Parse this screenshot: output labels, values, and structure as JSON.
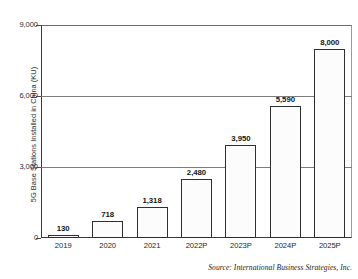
{
  "chart_data": {
    "type": "bar",
    "title": "",
    "subtitle": "",
    "xlabel": "",
    "ylabel": "5G Base Stations Installed in China (KU)",
    "categories": [
      "2019",
      "2020",
      "2021",
      "2022P",
      "2023P",
      "2024P",
      "2025P"
    ],
    "values": [
      130,
      718,
      1318,
      2480,
      3950,
      5590,
      8000
    ],
    "value_labels": [
      "130",
      "718",
      "1,318",
      "2,480",
      "3,950",
      "5,590",
      "8,000"
    ],
    "series": [
      {
        "name": "5G Base Stations Installed in China (KU)",
        "values": [
          130,
          718,
          1318,
          2480,
          3950,
          5590,
          8000
        ]
      }
    ],
    "ylim": [
      0,
      9000
    ],
    "y_ticks": [
      0,
      3000,
      6000,
      9000
    ],
    "y_tick_labels": [
      "0",
      "3,000",
      "6,000",
      "9,000"
    ],
    "grid": "horizontal",
    "legend": "none",
    "bar_fill": "#fcfcfc",
    "bar_edge": "#2f2f2f",
    "axis_color": "#3a3a3a",
    "text_color": "#151515",
    "annotations": [
      "Source: International Business Strategies, Inc."
    ]
  },
  "source": {
    "text": "Source: International Business Strategies, Inc."
  }
}
